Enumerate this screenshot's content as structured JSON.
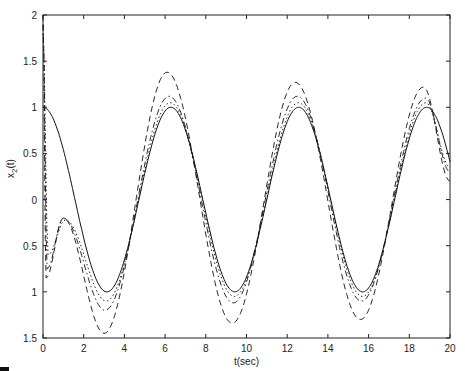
{
  "chart_data": {
    "type": "line",
    "title": "",
    "xlabel": "t(sec)",
    "ylabel": "x_2(t)",
    "xlim": [
      0,
      20
    ],
    "ylim": [
      -1.5,
      2
    ],
    "grid": false,
    "legend": null,
    "x_ticks": [
      0,
      2,
      4,
      6,
      8,
      10,
      12,
      14,
      16,
      18,
      20
    ],
    "x_tick_labels": [
      "0",
      "2",
      "4",
      "6",
      "8",
      "10",
      "12",
      "14",
      "16",
      "18",
      "20"
    ],
    "y_ticks": [
      2,
      1.5,
      1,
      0.5,
      0,
      -0.5,
      -1,
      -1.5
    ],
    "y_tick_labels": [
      "2",
      "1.5",
      "1",
      "0.5",
      "0",
      "0.5",
      "1",
      "1.5"
    ],
    "series": [
      {
        "name": "reference cos(t)",
        "style": "solid",
        "x": [
          0,
          3.14,
          6.28,
          9.42,
          12.57,
          15.71,
          18.85,
          20
        ],
        "values": [
          1.0,
          -1.0,
          1.0,
          -1.0,
          1.0,
          -1.0,
          1.0,
          0.41
        ]
      },
      {
        "name": "estimate 1",
        "style": "dashed",
        "x": [
          0,
          0.15,
          1.0,
          3.0,
          6.1,
          9.3,
          12.4,
          15.6,
          18.7,
          20
        ],
        "values": [
          2.0,
          -0.85,
          -0.2,
          -1.45,
          1.38,
          -1.34,
          1.27,
          -1.3,
          1.22,
          0.2
        ]
      },
      {
        "name": "estimate 2",
        "style": "dashdot",
        "x": [
          0,
          0.2,
          1.0,
          3.05,
          6.2,
          9.35,
          12.5,
          15.65,
          18.8,
          20
        ],
        "values": [
          1.9,
          -0.75,
          -0.2,
          -1.2,
          1.12,
          -1.12,
          1.12,
          -1.1,
          1.1,
          0.3
        ]
      },
      {
        "name": "estimate 3",
        "style": "dotted",
        "x": [
          0,
          0.25,
          1.1,
          3.1,
          6.25,
          9.4,
          12.55,
          15.7,
          18.82,
          20
        ],
        "values": [
          1.8,
          -0.6,
          -0.22,
          -1.1,
          1.05,
          -1.05,
          1.05,
          -1.05,
          1.05,
          0.35
        ]
      }
    ]
  },
  "plot": {
    "left": 43,
    "top": 15,
    "right": 450,
    "bottom": 338,
    "line_color": "#111111",
    "axis_color": "#222222",
    "background": "#ffffff"
  }
}
